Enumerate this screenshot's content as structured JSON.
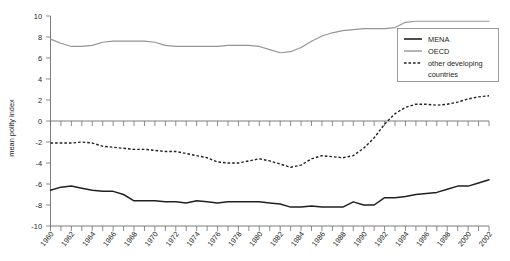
{
  "chart_data": {
    "type": "line",
    "title": "",
    "xlabel": "",
    "ylabel": "mean polity index",
    "xlim": [
      1960,
      2002
    ],
    "ylim": [
      -10,
      10
    ],
    "grid": false,
    "legend_position": "top-right",
    "y_ticks": [
      10,
      8,
      6,
      4,
      2,
      0,
      -2,
      -4,
      -6,
      -8,
      -10
    ],
    "y_tick_labels": [
      "10",
      "8",
      "6",
      "4",
      "2",
      "0",
      "-2",
      "-4",
      "-6",
      "-8",
      "-10"
    ],
    "x_tick_labels": [
      "1960",
      "1962",
      "1964",
      "1966",
      "1968",
      "1970",
      "1972",
      "1974",
      "1976",
      "1978",
      "1980",
      "1982",
      "1984",
      "1986",
      "1988",
      "1990",
      "1992",
      "1994",
      "1996",
      "1998",
      "2000",
      "2002"
    ],
    "x": [
      1960,
      1961,
      1962,
      1963,
      1964,
      1965,
      1966,
      1967,
      1968,
      1969,
      1970,
      1971,
      1972,
      1973,
      1974,
      1975,
      1976,
      1977,
      1978,
      1979,
      1980,
      1981,
      1982,
      1983,
      1984,
      1985,
      1986,
      1987,
      1988,
      1989,
      1990,
      1991,
      1992,
      1993,
      1994,
      1995,
      1996,
      1997,
      1998,
      1999,
      2000,
      2001,
      2002
    ],
    "series": [
      {
        "name": "MENA",
        "style": "solid",
        "color": "#231f20",
        "values": [
          -6.6,
          -6.3,
          -6.2,
          -6.4,
          -6.6,
          -6.7,
          -6.7,
          -7.0,
          -7.6,
          -7.6,
          -7.6,
          -7.7,
          -7.7,
          -7.8,
          -7.6,
          -7.7,
          -7.8,
          -7.7,
          -7.7,
          -7.7,
          -7.7,
          -7.8,
          -7.9,
          -8.2,
          -8.2,
          -8.1,
          -8.2,
          -8.2,
          -8.2,
          -7.7,
          -8.0,
          -8.0,
          -7.3,
          -7.3,
          -7.2,
          -7.0,
          -6.9,
          -6.8,
          -6.5,
          -6.2,
          -6.2,
          -5.9,
          -5.6
        ]
      },
      {
        "name": "OECD",
        "style": "solid",
        "color": "#939598",
        "values": [
          7.8,
          7.4,
          7.1,
          7.1,
          7.2,
          7.5,
          7.6,
          7.6,
          7.6,
          7.6,
          7.5,
          7.2,
          7.1,
          7.1,
          7.1,
          7.1,
          7.1,
          7.2,
          7.2,
          7.2,
          7.1,
          6.8,
          6.5,
          6.6,
          7.0,
          7.6,
          8.1,
          8.4,
          8.6,
          8.7,
          8.8,
          8.8,
          8.8,
          8.9,
          9.4,
          9.5,
          9.5,
          9.5,
          9.5,
          9.5,
          9.5,
          9.5,
          9.5
        ]
      },
      {
        "name": "other developing countries",
        "style": "dashed",
        "color": "#231f20",
        "values": [
          -2.1,
          -2.1,
          -2.1,
          -2.0,
          -2.1,
          -2.4,
          -2.5,
          -2.6,
          -2.7,
          -2.7,
          -2.8,
          -2.9,
          -2.9,
          -3.1,
          -3.3,
          -3.5,
          -3.9,
          -4.0,
          -4.0,
          -3.8,
          -3.6,
          -3.8,
          -4.1,
          -4.4,
          -4.2,
          -3.6,
          -3.3,
          -3.4,
          -3.5,
          -3.3,
          -2.6,
          -1.6,
          -0.3,
          0.7,
          1.3,
          1.6,
          1.6,
          1.5,
          1.6,
          1.8,
          2.1,
          2.3,
          2.4
        ]
      }
    ]
  },
  "legend": {
    "items": [
      {
        "label": "MENA"
      },
      {
        "label": "OECD"
      },
      {
        "label": "other developing"
      },
      {
        "label": "countries"
      }
    ]
  }
}
